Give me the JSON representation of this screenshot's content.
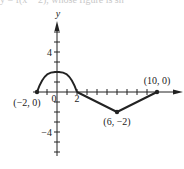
{
  "caption_fragment": "y = f(x − 2), whose figure is sh",
  "chart_data": {
    "type": "line",
    "title": "",
    "xlabel": "x",
    "ylabel": "y",
    "xlim": [
      -2,
      10
    ],
    "ylim": [
      -6,
      7
    ],
    "x_tick_labels": [
      {
        "value": 0,
        "label": "0"
      },
      {
        "value": 2,
        "label": "2"
      }
    ],
    "y_tick_labels": [
      {
        "value": 4,
        "label": "4"
      },
      {
        "value": -4,
        "label": "-4"
      }
    ],
    "x_ticks": [
      -1,
      1,
      2,
      3,
      4,
      5,
      6,
      7,
      8,
      9
    ],
    "y_ticks": [
      -6,
      -5,
      -4,
      -3,
      -2,
      -1,
      1,
      2,
      3,
      4,
      5,
      6
    ],
    "series": [
      {
        "name": "f",
        "segments": [
          {
            "kind": "curve",
            "points": [
              [
                -2,
                0
              ],
              [
                -1,
                1.5
              ],
              [
                0,
                2
              ],
              [
                1,
                1.5
              ],
              [
                2,
                0
              ]
            ]
          },
          {
            "kind": "line",
            "points": [
              [
                2,
                0
              ],
              [
                6,
                -2
              ]
            ]
          },
          {
            "kind": "line",
            "points": [
              [
                6,
                -2
              ],
              [
                10,
                0
              ]
            ]
          }
        ]
      }
    ],
    "annotations": [
      {
        "point": [
          -2,
          0
        ],
        "label": "(−2, 0)",
        "position": "below-left"
      },
      {
        "point": [
          10,
          0
        ],
        "label": "(10, 0)",
        "position": "above"
      },
      {
        "point": [
          6,
          -2
        ],
        "label": "(6, −2)",
        "position": "below"
      }
    ],
    "grid": false,
    "legend": "none"
  }
}
